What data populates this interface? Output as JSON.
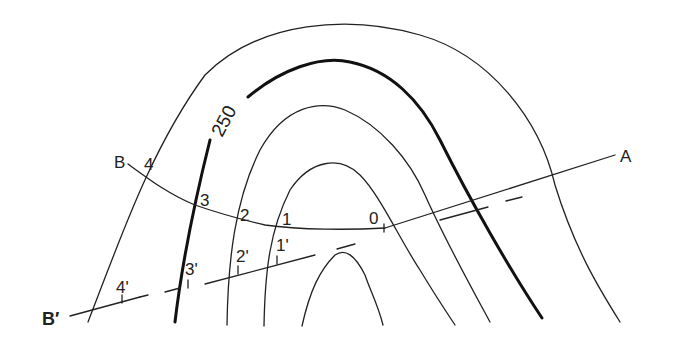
{
  "diagram": {
    "type": "contour-profile-construction",
    "contour_label": "250",
    "line_labels": {
      "B": "B",
      "A": "A",
      "B_prime": "B′"
    },
    "points_on_BA": [
      "4",
      "3",
      "2",
      "1",
      "0"
    ],
    "points_on_Bprime": [
      "4'",
      "3'",
      "2'",
      "1'"
    ],
    "colors": {
      "ink": "#222222",
      "background": "#ffffff"
    }
  }
}
